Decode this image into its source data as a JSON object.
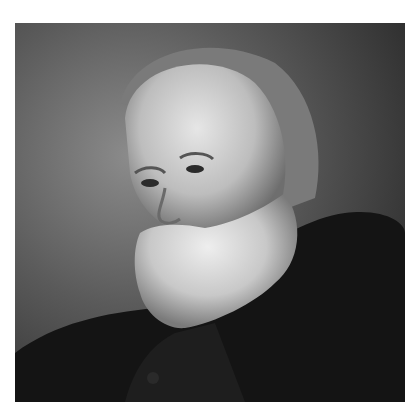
{
  "image": {
    "alt": "Black and white vintage portrait of an elderly man with a full white beard, balding head, looking to the left, wearing a dark fur-collared coat",
    "palette": {
      "background": "#ffffff",
      "photo_light": "#d8d8d8",
      "photo_mid": "#6a6a6a",
      "photo_dark": "#111111"
    }
  }
}
